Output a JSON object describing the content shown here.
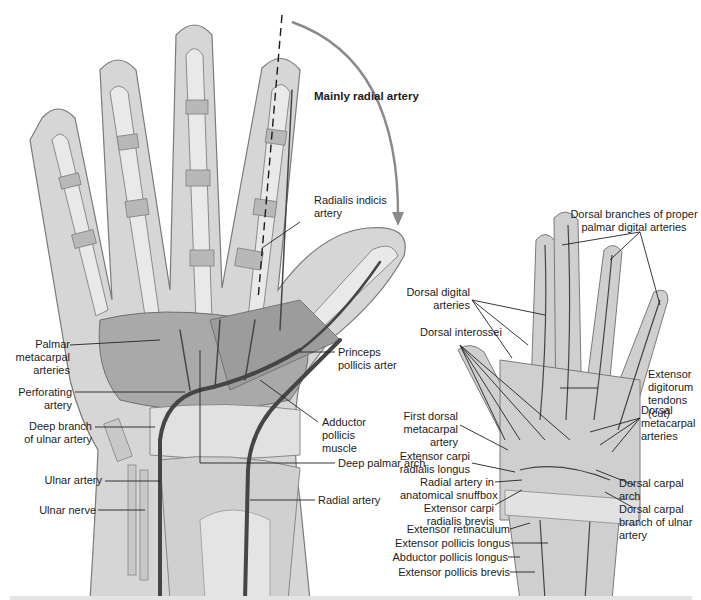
{
  "figure": {
    "type": "anatomical-illustration",
    "views": [
      "palmar view (left)",
      "dorsal view (right)"
    ]
  },
  "annotations": {
    "arc_label": "Mainly radial artery"
  },
  "palmar_view": {
    "labels": {
      "radialis_indicis": [
        "Radialis indicis",
        "artery"
      ],
      "palmar_metacarpal": [
        "Palmar",
        "metacarpal",
        "arteries"
      ],
      "perforating": [
        "Perforating",
        "artery"
      ],
      "deep_branch_ulnar": [
        "Deep branch",
        "of ulnar artery"
      ],
      "ulnar_artery": "Ulnar artery",
      "ulnar_nerve": "Ulnar nerve",
      "princeps_pollicis": [
        "Princeps",
        "pollicis arter"
      ],
      "adductor_pollicis": [
        "Adductor",
        "pollicis",
        "muscle"
      ],
      "deep_palmar_arch": "Deep palmar arch",
      "radial_artery": "Radial artery"
    }
  },
  "dorsal_view": {
    "labels": {
      "dorsal_branches": [
        "Dorsal branches of proper",
        "palmar digital arteries"
      ],
      "dorsal_digital": [
        "Dorsal digital",
        "arteries"
      ],
      "dorsal_interossei": "Dorsal interossei",
      "extensor_digitorum": [
        "Extensor",
        "digitorum",
        "tendons",
        "(cut)"
      ],
      "first_dorsal_metacarpal": [
        "First dorsal",
        "metacarpal",
        "artery"
      ],
      "ecr_longus": [
        "Extensor carpi",
        "radialis longus"
      ],
      "radial_snuffbox": [
        "Radial artery in",
        "anatomical snuffbox"
      ],
      "ecr_brevis": [
        "Extensor carpi",
        "radialis brevis"
      ],
      "dorsal_metacarpal": [
        "Dorsal",
        "metacarpal",
        "arteries"
      ],
      "dorsal_carpal_arch": [
        "Dorsal carpal",
        "arch"
      ],
      "dorsal_carpal_branch_ulnar": [
        "Dorsal carpal",
        "branch of ulnar",
        "artery"
      ],
      "extensor_retinaculum": "Extensor retinaculum",
      "extensor_pollicis_longus": "Extensor pollicis longus",
      "abductor_pollicis_longus": "Abductor pollicis longus",
      "extensor_pollicis_brevis": "Extensor pollicis brevis"
    }
  },
  "colors": {
    "skin_outline_fill": "#d9d9d9",
    "tissue": "#bdbdbd",
    "bone": "#e6e6e6",
    "artery": "#4a4a4a",
    "arrow": "#8a8a8a",
    "leader": "#222222"
  }
}
